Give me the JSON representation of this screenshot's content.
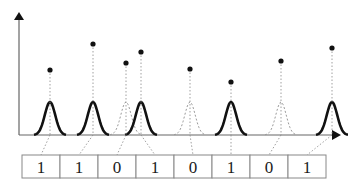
{
  "diagram": {
    "colors": {
      "solid_pulse": "#111111",
      "dashed_pulse": "#9a9a9a",
      "axis": "#555555",
      "dot": "#111111",
      "cell_border": "#888888"
    },
    "bits": [
      "1",
      "1",
      "0",
      "1",
      "0",
      "1",
      "0",
      "1"
    ],
    "pulses": [
      {
        "cx": 50,
        "style": "solid",
        "dot_y": 70,
        "cell": 0
      },
      {
        "cx": 93,
        "style": "solid",
        "dot_y": 44,
        "cell": 1
      },
      {
        "cx": 126,
        "style": "dashed",
        "dot_y": 63,
        "cell": 2
      },
      {
        "cx": 141,
        "style": "solid",
        "dot_y": 52,
        "cell": 3
      },
      {
        "cx": 190,
        "style": "dashed",
        "dot_y": 69,
        "cell": 4
      },
      {
        "cx": 231,
        "style": "solid",
        "dot_y": 82,
        "cell": 5
      },
      {
        "cx": 281,
        "style": "dashed",
        "dot_y": 61,
        "cell": 6
      },
      {
        "cx": 332,
        "style": "solid",
        "dot_y": 48,
        "cell": 7
      }
    ]
  }
}
